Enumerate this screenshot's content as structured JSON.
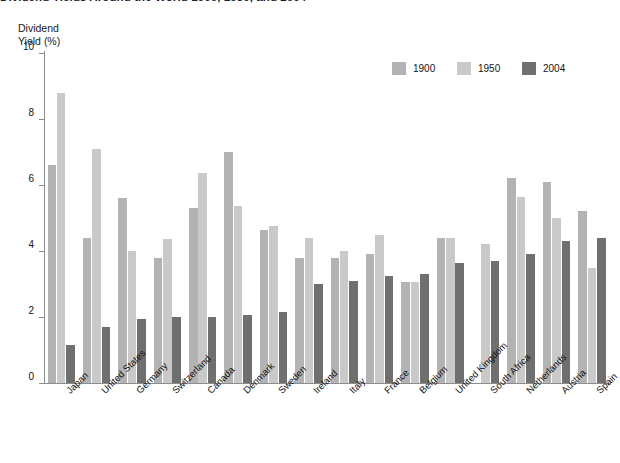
{
  "figure": {
    "title": "Dividend Yields Around the World 1900, 1950, and 2004",
    "axis_title_line1": "Dividend",
    "axis_title_line2": "Yield (%)"
  },
  "legend": {
    "position": "top-right",
    "items": [
      {
        "label": "1900",
        "color": "#b3b3b3"
      },
      {
        "label": "1950",
        "color": "#c9c9c9"
      },
      {
        "label": "2004",
        "color": "#6f6f6f"
      }
    ]
  },
  "chart_data": {
    "type": "bar",
    "title": "Dividend Yields Around the World 1900, 1950, and 2004",
    "xlabel": "",
    "ylabel": "Dividend Yield (%)",
    "ylim": [
      0,
      10
    ],
    "yticks": [
      0,
      2,
      4,
      6,
      8,
      10
    ],
    "grid": false,
    "legend_position": "top-right",
    "categories": [
      "Japan",
      "United States",
      "Germany",
      "Switzerland",
      "Canada",
      "Denmark",
      "Sweden",
      "Ireland",
      "Italy",
      "France",
      "Belgium",
      "United Kingdom",
      "South Africa",
      "Netherlands",
      "Austria",
      "Spain"
    ],
    "series": [
      {
        "name": "1900",
        "color": "#b3b3b3",
        "values": [
          6.6,
          4.4,
          5.6,
          3.8,
          5.3,
          7.0,
          4.65,
          3.8,
          3.8,
          3.9,
          3.05,
          4.4,
          0.0,
          6.2,
          6.1,
          5.2
        ]
      },
      {
        "name": "1950",
        "color": "#c9c9c9",
        "values": [
          8.8,
          7.1,
          4.0,
          4.35,
          6.35,
          5.35,
          4.75,
          4.4,
          4.0,
          4.5,
          3.05,
          4.4,
          4.2,
          5.65,
          5.0,
          3.5
        ]
      },
      {
        "name": "2004",
        "color": "#6f6f6f",
        "values": [
          1.15,
          1.7,
          1.95,
          2.0,
          2.0,
          2.05,
          2.15,
          3.0,
          3.1,
          3.25,
          3.3,
          3.65,
          3.7,
          3.9,
          4.3,
          4.4
        ]
      }
    ]
  }
}
